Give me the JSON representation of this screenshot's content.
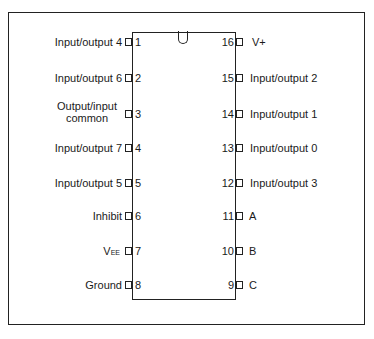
{
  "diagram": {
    "type": "IC pinout (16-pin DIP)",
    "left_pins": [
      {
        "number": "1",
        "label": "Input/output 4"
      },
      {
        "number": "2",
        "label": "Input/output 6"
      },
      {
        "number": "3",
        "label_line1": "Output/input",
        "label_line2": "common"
      },
      {
        "number": "4",
        "label": "Input/output 7"
      },
      {
        "number": "5",
        "label": "Input/output 5"
      },
      {
        "number": "6",
        "label": "Inhibit"
      },
      {
        "number": "7",
        "label_main": "V",
        "label_sub": "EE"
      },
      {
        "number": "8",
        "label": "Ground"
      }
    ],
    "right_pins": [
      {
        "number": "16",
        "label": "V+"
      },
      {
        "number": "15",
        "label": "Input/output 2"
      },
      {
        "number": "14",
        "label": "Input/output 1"
      },
      {
        "number": "13",
        "label": "Input/output 0"
      },
      {
        "number": "12",
        "label": "Input/output 3"
      },
      {
        "number": "11",
        "label": "A"
      },
      {
        "number": "10",
        "label": "B"
      },
      {
        "number": "9",
        "label": "C"
      }
    ]
  }
}
